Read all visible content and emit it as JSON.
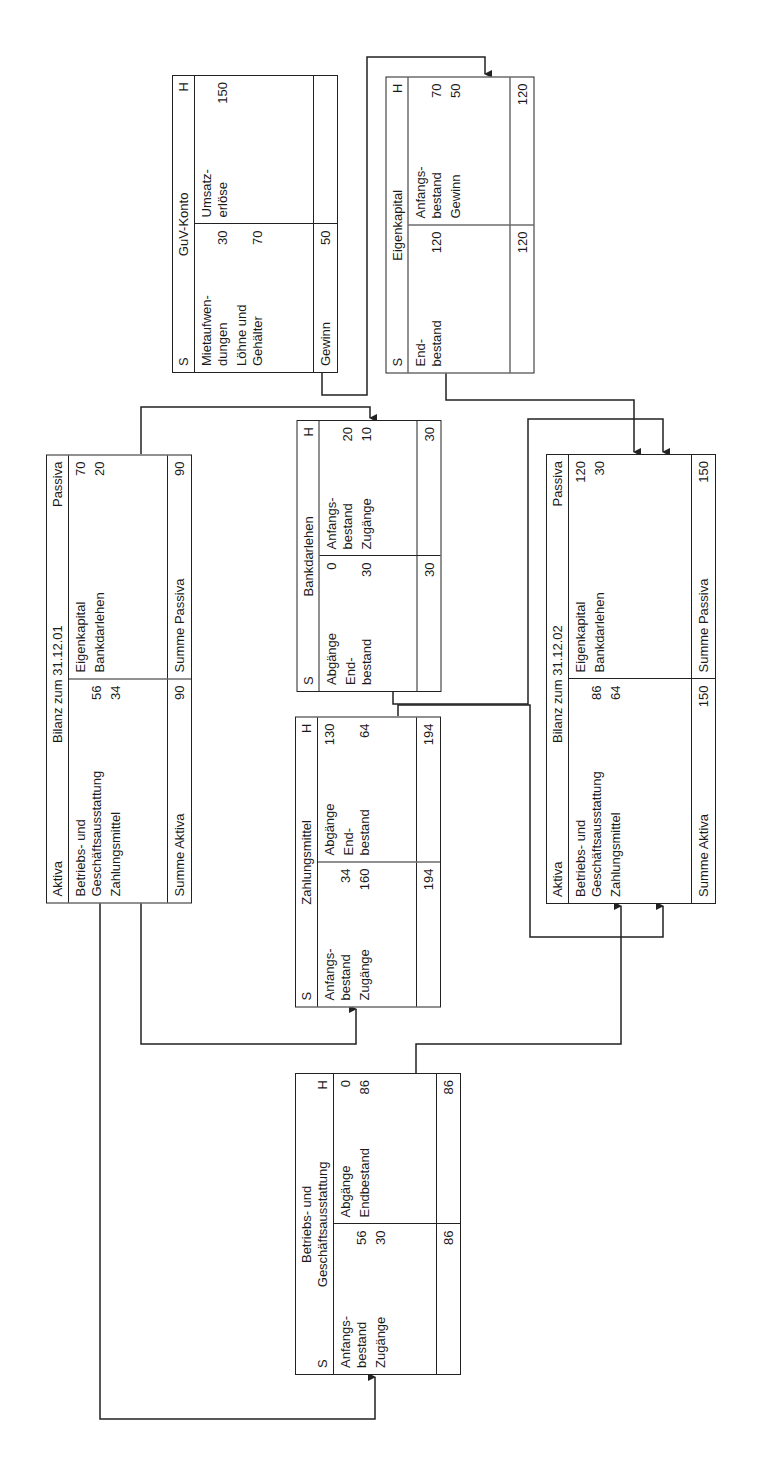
{
  "bilanz_0101": {
    "left_header": "Aktiva",
    "title": "Bilanz zum 31.12.01",
    "right_header": "Passiva",
    "left_rows": [
      {
        "label": "Betriebs- und\nGeschäftsausstattung",
        "value": "56"
      },
      {
        "label": "Zahlungsmittel",
        "value": "34"
      }
    ],
    "right_rows": [
      {
        "label": "Eigenkapital",
        "value": "70"
      },
      {
        "label": "Bankdarlehen",
        "value": "20"
      }
    ],
    "left_sum_label": "Summe Aktiva",
    "left_sum": "90",
    "right_sum_label": "Summe Passiva",
    "right_sum": "90"
  },
  "guv": {
    "left_header": "S",
    "title": "GuV-Konto",
    "right_header": "H",
    "left_rows": [
      {
        "label": "Mietaufwen-\ndungen",
        "value": "30"
      },
      {
        "label": "Löhne und\nGehälter",
        "value": "70"
      }
    ],
    "right_rows": [
      {
        "label": "Umsatz-\nerlöse",
        "value": "150"
      }
    ],
    "left_sum_label": "Gewinn",
    "left_sum": "50",
    "right_sum_label": "",
    "right_sum": ""
  },
  "eigenkapital": {
    "left_header": "S",
    "title": "Eigenkapital",
    "right_header": "H",
    "left_rows": [
      {
        "label": "End-\nbestand",
        "value": "120"
      }
    ],
    "right_rows": [
      {
        "label": "Anfangs-\nbestand",
        "value": "70"
      },
      {
        "label": "Gewinn",
        "value": "50"
      }
    ],
    "left_sum_label": "",
    "left_sum": "120",
    "right_sum_label": "",
    "right_sum": "120"
  },
  "bankdarlehen": {
    "left_header": "S",
    "title": "Bankdarlehen",
    "right_header": "H",
    "left_rows": [
      {
        "label": "Abgänge",
        "value": "0"
      },
      {
        "label": "End-\nbestand",
        "value": "30"
      }
    ],
    "right_rows": [
      {
        "label": "Anfangs-\nbestand",
        "value": "20"
      },
      {
        "label": "Zugänge",
        "value": "10"
      }
    ],
    "left_sum_label": "",
    "left_sum": "30",
    "right_sum_label": "",
    "right_sum": "30"
  },
  "zahlungsmittel": {
    "left_header": "S",
    "title": "Zahlungsmittel",
    "right_header": "H",
    "left_rows": [
      {
        "label": "Anfangs-\nbestand",
        "value": "34"
      },
      {
        "label": "Zugänge",
        "value": "160"
      }
    ],
    "right_rows": [
      {
        "label": "Abgänge",
        "value": "130"
      },
      {
        "label": "End-\nbestand",
        "value": "64"
      }
    ],
    "left_sum_label": "",
    "left_sum": "194",
    "right_sum_label": "",
    "right_sum": "194"
  },
  "bilanz_0102": {
    "left_header": "Aktiva",
    "title": "Bilanz zum 31.12.02",
    "right_header": "Passiva",
    "left_rows": [
      {
        "label": "Betriebs- und\nGeschäftsausstattung",
        "value": "86"
      },
      {
        "label": "Zahlungsmittel",
        "value": "64"
      }
    ],
    "right_rows": [
      {
        "label": "Eigenkapital",
        "value": "120"
      },
      {
        "label": "Bankdarlehen",
        "value": "30"
      }
    ],
    "left_sum_label": "Summe Aktiva",
    "left_sum": "150",
    "right_sum_label": "Summe Passiva",
    "right_sum": "150"
  },
  "bga": {
    "left_header": "S",
    "title": "Betriebs- und\nGeschäftsausstattung",
    "right_header": "H",
    "left_rows": [
      {
        "label": "Anfangs-\nbestand",
        "value": "56"
      },
      {
        "label": "Zugänge",
        "value": "30"
      }
    ],
    "right_rows": [
      {
        "label": "Abgänge",
        "value": "0"
      },
      {
        "label": "Endbestand",
        "value": "86"
      }
    ],
    "left_sum_label": "",
    "left_sum": "86",
    "right_sum_label": "",
    "right_sum": "86"
  },
  "colors": {
    "line": "#222222",
    "background": "#ffffff"
  }
}
